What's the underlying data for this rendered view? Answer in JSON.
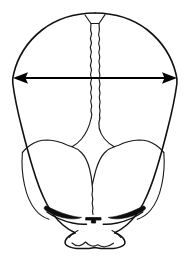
{
  "figure": {
    "title": "Infant skull, superior-frontal view with biparietal diameter",
    "background_color": "#ffffff",
    "line_color": "#111111",
    "width": 190,
    "height": 258
  },
  "measurement": {
    "name": "biparietal-diameter",
    "label": "",
    "arrow_style": "double-headed",
    "orientation": "horizontal",
    "start_x": 13,
    "end_x": 177,
    "y": 78,
    "color": "#000000"
  },
  "anatomy": {
    "parts": [
      {
        "id": "cranial-vault",
        "label": "Cranial vault outline",
        "interactable": false
      },
      {
        "id": "sagittal-suture",
        "label": "Sagittal suture",
        "interactable": false
      },
      {
        "id": "anterior-fontanelle",
        "label": "Anterior fontanelle",
        "interactable": false
      },
      {
        "id": "coronal-suture-left",
        "label": "Left coronal suture",
        "interactable": false
      },
      {
        "id": "coronal-suture-right",
        "label": "Right coronal suture",
        "interactable": false
      },
      {
        "id": "frontal-bone-left",
        "label": "Left frontal bone",
        "interactable": false
      },
      {
        "id": "frontal-bone-right",
        "label": "Right frontal bone",
        "interactable": false
      },
      {
        "id": "supraorbital-ridge-left",
        "label": "Left supraorbital ridge",
        "interactable": false
      },
      {
        "id": "supraorbital-ridge-right",
        "label": "Right supraorbital ridge",
        "interactable": false
      },
      {
        "id": "nose",
        "label": "Nose",
        "interactable": false
      },
      {
        "id": "chin",
        "label": "Chin",
        "interactable": false
      },
      {
        "id": "metopic-suture",
        "label": "Metopic suture",
        "interactable": false
      }
    ]
  }
}
